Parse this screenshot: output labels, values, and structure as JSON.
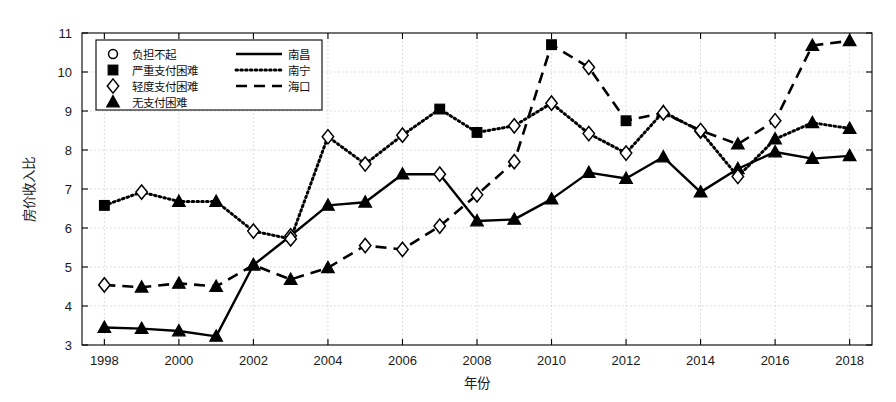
{
  "chart_data": {
    "type": "line",
    "title": "",
    "xlabel": "年份",
    "ylabel": "房价收入比",
    "xlim": [
      1997.4,
      2018.6
    ],
    "ylim": [
      3,
      11
    ],
    "grid": true,
    "x": [
      1998,
      1999,
      2000,
      2001,
      2002,
      2003,
      2004,
      2005,
      2006,
      2007,
      2008,
      2009,
      2010,
      2011,
      2012,
      2013,
      2014,
      2015,
      2016,
      2017,
      2018
    ],
    "xticks": [
      1998,
      2000,
      2002,
      2004,
      2006,
      2008,
      2010,
      2012,
      2014,
      2016,
      2018
    ],
    "yticks": [
      3,
      4,
      5,
      6,
      7,
      8,
      9,
      10,
      11
    ],
    "legend_position": "upper-left",
    "series": [
      {
        "name": "南昌",
        "line_style": "solid",
        "values": [
          3.45,
          3.42,
          3.36,
          3.22,
          5.05,
          5.8,
          6.58,
          6.66,
          7.38,
          7.38,
          6.18,
          6.22,
          6.74,
          7.42,
          7.27,
          7.82,
          6.92,
          7.52,
          7.95,
          7.78,
          7.85
        ],
        "markers": [
          "triangle",
          "triangle",
          "triangle",
          "triangle",
          "triangle",
          "diamond",
          "triangle",
          "triangle",
          "triangle",
          "diamond",
          "triangle",
          "triangle",
          "triangle",
          "triangle",
          "triangle",
          "triangle",
          "triangle",
          "triangle",
          "triangle",
          "triangle",
          "triangle"
        ]
      },
      {
        "name": "南宁",
        "line_style": "dotted",
        "values": [
          6.58,
          6.92,
          6.68,
          6.68,
          5.92,
          5.72,
          8.34,
          7.64,
          8.38,
          9.05,
          8.45,
          8.62,
          9.2,
          8.42,
          7.92,
          8.98,
          8.48,
          7.32,
          8.28,
          8.7,
          8.55
        ],
        "markers": [
          "square",
          "diamond",
          "triangle",
          "triangle",
          "diamond",
          "diamond",
          "diamond",
          "diamond",
          "diamond",
          "square",
          "square",
          "diamond",
          "diamond",
          "diamond",
          "diamond",
          "triangle",
          "diamond",
          "diamond",
          "triangle",
          "triangle",
          "triangle"
        ]
      },
      {
        "name": "海口",
        "line_style": "dashed",
        "values": [
          4.54,
          4.48,
          4.58,
          4.5,
          5.05,
          4.68,
          4.98,
          5.55,
          5.45,
          6.05,
          6.85,
          7.7,
          10.7,
          10.12,
          8.75,
          8.95,
          8.5,
          8.15,
          8.75,
          10.68,
          10.8
        ],
        "markers": [
          "diamond",
          "triangle",
          "triangle",
          "triangle",
          "triangle",
          "triangle",
          "triangle",
          "diamond",
          "diamond",
          "diamond",
          "diamond",
          "diamond",
          "square",
          "diamond",
          "square",
          "diamond",
          "diamond",
          "triangle",
          "diamond",
          "triangle",
          "triangle"
        ]
      }
    ],
    "marker_legend": [
      {
        "marker": "circle",
        "label": "负担不起"
      },
      {
        "marker": "square",
        "label": "严重支付困难"
      },
      {
        "marker": "diamond",
        "label": "轻度支付困难"
      },
      {
        "marker": "triangle",
        "label": "无支付困难"
      }
    ],
    "line_legend": [
      {
        "line_style": "solid",
        "label": "南昌"
      },
      {
        "line_style": "dotted",
        "label": "南宁"
      },
      {
        "line_style": "dashed",
        "label": "海口"
      }
    ],
    "colors": {
      "line": "#000000",
      "grid": "#c8c8c8",
      "axis": "#000000",
      "background": "#ffffff"
    }
  }
}
